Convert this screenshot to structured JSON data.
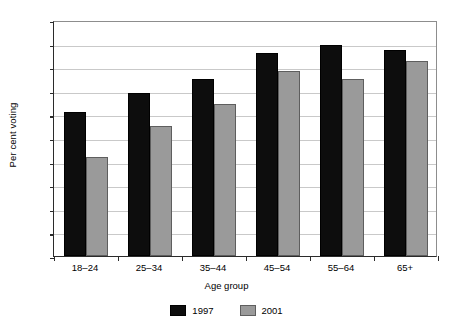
{
  "chart_data": {
    "type": "bar",
    "title": "",
    "subtitle": "",
    "xlabel": "Age group",
    "ylabel": "Per cent voting",
    "categories": [
      "18–24",
      "25–34",
      "35–44",
      "45–54",
      "55–64",
      "65+"
    ],
    "series": [
      {
        "name": "1997",
        "color": "#0d0d0d",
        "values": [
          61,
          69,
          75,
          86,
          89.5,
          87.5
        ]
      },
      {
        "name": "2001",
        "color": "#9a9a9a",
        "values": [
          42,
          55,
          64.5,
          78.5,
          75,
          82.5
        ]
      }
    ],
    "ylim": [
      0,
      100
    ],
    "ytick_labels": [
      "0",
      "10",
      "20",
      "30",
      "40",
      "50",
      "60",
      "70",
      "80",
      "90",
      "100"
    ],
    "ytick_values": [
      0,
      10,
      20,
      30,
      40,
      50,
      60,
      70,
      80,
      90,
      100
    ],
    "grid": true,
    "grid_axis": "y",
    "legend": [
      "1997",
      "2001"
    ],
    "legend_position": "bottom-center"
  }
}
